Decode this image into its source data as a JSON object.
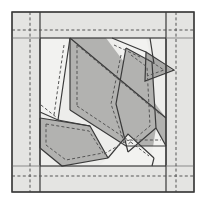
{
  "document": {
    "title": "Quilt Block Paper-Piecing Pattern",
    "kind": "geometric-pattern-diagram",
    "width": 206,
    "height": 204
  },
  "colors": {
    "page_background": "#ffffff",
    "border_fill": "#e4e4e2",
    "background_patch": "#ededeb",
    "light_patch": "#f2f2f0",
    "medium_patch": "#b2b2b0",
    "dark_patch": "#a9a9a7",
    "outline": "#3a3a3a",
    "seam_dash": "#555555",
    "grid_line": "#888888"
  },
  "frame": {
    "outer_border": {
      "name": "outer-border-rectangle",
      "x": 12,
      "y": 12,
      "width": 182,
      "height": 180,
      "stroke_width": 1.2
    },
    "inner_block": {
      "name": "inner-block-rectangle",
      "x": 40,
      "y": 38,
      "width": 126,
      "height": 128,
      "stroke_width": 1.2
    },
    "border_strips": [
      {
        "name": "left-border-strip",
        "orientation": "vertical",
        "x": 40
      },
      {
        "name": "right-border-strip",
        "orientation": "vertical",
        "x": 166
      },
      {
        "name": "top-border-strip",
        "orientation": "horizontal",
        "y": 38
      },
      {
        "name": "bottom-border-strip",
        "orientation": "horizontal",
        "y": 166
      }
    ],
    "register_lines": [
      {
        "name": "register-line-top",
        "orientation": "horizontal",
        "y": 38,
        "x1": 12,
        "x2": 40
      },
      {
        "name": "register-line-bottom",
        "orientation": "horizontal",
        "y": 166,
        "x1": 12,
        "x2": 40
      },
      {
        "name": "register-line-top-right",
        "orientation": "horizontal",
        "y": 38,
        "x1": 166,
        "x2": 194
      },
      {
        "name": "register-line-bottom-right",
        "orientation": "horizontal",
        "y": 166,
        "x1": 166,
        "x2": 194
      }
    ],
    "seam_allowance_guides": [
      {
        "name": "seam-guide-left",
        "orientation": "vertical",
        "x": 30,
        "y1": 12,
        "y2": 192
      },
      {
        "name": "seam-guide-right",
        "orientation": "vertical",
        "x": 176,
        "y1": 12,
        "y2": 192
      },
      {
        "name": "seam-guide-top",
        "orientation": "horizontal",
        "y": 30,
        "x1": 12,
        "x2": 194
      },
      {
        "name": "seam-guide-bottom",
        "orientation": "horizontal",
        "y": 176,
        "x1": 12,
        "x2": 194
      }
    ]
  },
  "patches": [
    {
      "name": "patch-background",
      "shade": "background_patch",
      "points": "40,38 166,38 166,166 40,166"
    },
    {
      "name": "patch-light-upper-left",
      "shade": "light_patch",
      "points": "40,38 70,38 58,120 40,112"
    },
    {
      "name": "patch-light-upper-right-wing",
      "shade": "light_patch",
      "points": "118,38 146,38 152,62 124,74"
    },
    {
      "name": "patch-medium-body",
      "shade": "medium_patch",
      "points": "70,38 106,38 166,118 166,146 126,146 70,110"
    },
    {
      "name": "patch-medium-wing-right",
      "shade": "medium_patch",
      "points": "126,48 152,62 156,128 128,152 116,104"
    },
    {
      "name": "patch-dark-beak",
      "shade": "dark_patch",
      "points": "146,52 172,70 146,80"
    },
    {
      "name": "patch-medium-tail",
      "shade": "medium_patch",
      "points": "40,118 90,126 108,158 62,166 40,148"
    },
    {
      "name": "patch-light-lower-center",
      "shade": "light_patch",
      "points": "108,158 128,134 154,158 150,166 98,166"
    },
    {
      "name": "patch-light-lower-right",
      "shade": "light_patch",
      "points": "156,128 166,146 166,166 150,166"
    }
  ],
  "outlines": [
    {
      "name": "outline-body-upper-edge",
      "points": "70,38 166,118"
    },
    {
      "name": "outline-body-lower-edge",
      "points": "70,110 126,146 166,146"
    },
    {
      "name": "outline-body-left-edge",
      "points": "70,38 70,110"
    },
    {
      "name": "outline-wing-right-left",
      "points": "126,48 116,104 128,152"
    },
    {
      "name": "outline-wing-right-right",
      "points": "126,48 152,62 156,128 128,152"
    },
    {
      "name": "outline-beak",
      "points": "146,52 172,70 146,80 146,52"
    },
    {
      "name": "outline-tail-top",
      "points": "40,118 90,126 108,158"
    },
    {
      "name": "outline-tail-bottom",
      "points": "40,148 62,166"
    },
    {
      "name": "outline-tail-left",
      "points": "40,118 40,148"
    },
    {
      "name": "outline-tail-diag",
      "points": "62,166 108,158"
    },
    {
      "name": "outline-light-ul-right",
      "points": "70,38 58,120 40,112"
    },
    {
      "name": "outline-light-lower-center",
      "points": "108,158 128,134 154,158"
    },
    {
      "name": "outline-wing-upper-right",
      "points": "118,38 146,52"
    },
    {
      "name": "outline-lower-right-edge",
      "points": "156,128 166,146"
    },
    {
      "name": "outline-tail-fold",
      "points": "58,120 90,126"
    }
  ],
  "seam_lines": [
    {
      "name": "seam-body-upper",
      "points": "76,44 162,116"
    },
    {
      "name": "seam-body-lower",
      "points": "76,106 128,140 162,140"
    },
    {
      "name": "seam-body-left",
      "points": "76,44 76,106"
    },
    {
      "name": "seam-wing-left",
      "points": "122,54 112,104 126,146"
    },
    {
      "name": "seam-wing-right",
      "points": "132,54 148,66 150,126 126,146"
    },
    {
      "name": "seam-beak",
      "points": "148,58 164,70 148,76"
    },
    {
      "name": "seam-tail-top",
      "points": "46,124 90,132 104,154"
    },
    {
      "name": "seam-tail-bottom",
      "points": "46,144 66,160 104,154"
    },
    {
      "name": "seam-light-ul",
      "points": "64,44 54,116"
    },
    {
      "name": "seam-light-lower",
      "points": "104,154 128,140 150,156"
    },
    {
      "name": "seam-upper-wing-tip",
      "points": "114,44 140,56"
    },
    {
      "name": "seam-diag-ul-lower",
      "points": "40,104 58,118"
    }
  ],
  "labels": {
    "none_visible": ""
  }
}
